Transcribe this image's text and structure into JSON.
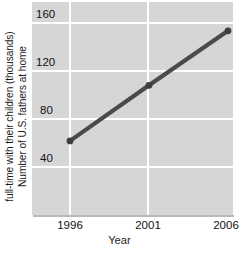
{
  "chart_data": {
    "type": "line",
    "title": "",
    "xlabel": "Year",
    "ylabel": "Number of U.S. fathers at home full-time with their children (thousands)",
    "ylabel_lines": [
      "Number of U.S. fathers at home",
      "full-time with their children (thousands)"
    ],
    "x": [
      1996,
      2001,
      2006
    ],
    "values": [
      40,
      98,
      155
    ],
    "series": [
      {
        "name": "Stay-at-home fathers",
        "values": [
          40,
          98,
          155
        ]
      }
    ],
    "xticks": [
      "1996",
      "2001",
      "2006"
    ],
    "xtick_values": [
      1996,
      2001,
      2006
    ],
    "yticks": [
      "40",
      "80",
      "120",
      "160"
    ],
    "ytick_values": [
      40,
      80,
      120,
      160
    ],
    "xlim": [
      1996,
      2006
    ],
    "ylim": [
      20,
      160
    ],
    "grid": true,
    "legend": false,
    "markers": true,
    "colors": {
      "plot_background": "#d6d6d6",
      "gridline": "#ffffff",
      "line": "#4a4a4a",
      "marker": "#3f3f3f",
      "text": "#111111",
      "page_background": "#ffffff"
    }
  }
}
